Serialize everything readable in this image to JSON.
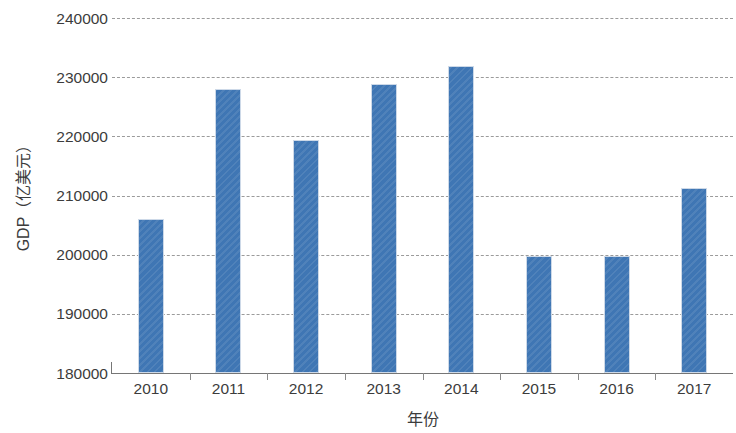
{
  "chart_data": {
    "type": "bar",
    "title": "",
    "xlabel": "年份",
    "ylabel": "GDP（亿美元）",
    "categories": [
      "2010",
      "2011",
      "2012",
      "2013",
      "2014",
      "2015",
      "2016",
      "2017"
    ],
    "values": [
      206100,
      228000,
      219400,
      228900,
      231900,
      199700,
      199700,
      211200
    ],
    "series": [
      {
        "name": "GDP",
        "values": [
          206100,
          228000,
          219400,
          228900,
          231900,
          199700,
          199700,
          211200
        ]
      }
    ],
    "ylim": [
      180000,
      240000
    ],
    "ytick_labels": [
      "180000",
      "190000",
      "200000",
      "210000",
      "220000",
      "230000",
      "240000"
    ],
    "ytick_values": [
      180000,
      190000,
      200000,
      210000,
      220000,
      230000,
      240000
    ],
    "grid": true,
    "grid_axis": "y",
    "grid_style": "dashed",
    "legend": false,
    "legend_position": "none",
    "bar_color": "#3f76b4",
    "grid_color": "#9b9b9b",
    "axis_color": "#767676",
    "background_color": "#ffffff"
  }
}
